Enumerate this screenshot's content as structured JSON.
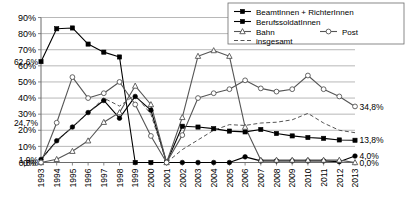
{
  "chart_data": {
    "type": "line",
    "title": "",
    "subtitle": "",
    "xlabel": "",
    "ylabel": "",
    "ylim": [
      0,
      90
    ],
    "xlim": [
      1993,
      2013
    ],
    "grid": true,
    "legend_position": "top-right",
    "ytick_labels": [
      "90%",
      "80%",
      "70%",
      "60%",
      "50%",
      "40%",
      "30%",
      "20%",
      "10%",
      "0%"
    ],
    "ytick_values": [
      90,
      80,
      70,
      60,
      50,
      40,
      30,
      20,
      10,
      0
    ],
    "categories": [
      "1993",
      "1994",
      "1995",
      "1996",
      "1997",
      "1998",
      "1999",
      "2000",
      "2001",
      "2002",
      "2003",
      "2004",
      "2005",
      "2006",
      "2007",
      "2008",
      "2009",
      "2010",
      "2011",
      "2012",
      "2013"
    ],
    "x": [
      1993,
      1994,
      1995,
      1996,
      1997,
      1998,
      1999,
      2000,
      2001,
      2002,
      2003,
      2004,
      2005,
      2006,
      2007,
      2008,
      2009,
      2010,
      2011,
      2012,
      2013
    ],
    "series": [
      {
        "name": "BeamtInnen + RichterInnen",
        "marker": "filled-square",
        "line": "solid",
        "color": "#000000",
        "values": [
          62.6,
          83.0,
          83.5,
          73.5,
          68.5,
          65.5,
          0.0,
          0.0,
          0.0,
          22.5,
          22.0,
          21.0,
          19.5,
          19.0,
          20.5,
          18.0,
          16.5,
          15.5,
          15.0,
          14.0,
          13.8
        ]
      },
      {
        "name": "BerufssoldatInnen",
        "marker": "filled-circle",
        "line": "solid",
        "color": "#000000",
        "values": [
          1.9,
          13.5,
          22.0,
          31.0,
          38.5,
          27.5,
          41.0,
          32.5,
          0.0,
          0.0,
          0.0,
          0.0,
          0.0,
          3.5,
          1.0,
          1.0,
          1.0,
          1.0,
          1.0,
          0.5,
          4.0
        ]
      },
      {
        "name": "Bahn",
        "marker": "open-triangle",
        "line": "solid",
        "color": "#555555",
        "values": [
          0.0,
          2.0,
          7.0,
          13.5,
          25.0,
          31.0,
          47.5,
          36.0,
          0.0,
          28.0,
          66.0,
          69.5,
          66.0,
          22.0,
          1.5,
          1.5,
          1.5,
          1.5,
          1.5,
          1.5,
          0.0
        ]
      },
      {
        "name": "Post",
        "marker": "open-circle",
        "line": "solid",
        "color": "#555555",
        "values": [
          0.0,
          24.7,
          53.0,
          40.0,
          43.0,
          50.0,
          36.0,
          16.5,
          0.0,
          17.0,
          40.0,
          43.0,
          45.5,
          51.0,
          46.0,
          44.0,
          45.5,
          54.0,
          45.5,
          41.0,
          34.8
        ]
      },
      {
        "name": "insgesamt",
        "marker": "none",
        "line": "dashed",
        "color": "#555555",
        "values": [
          1.5,
          13.0,
          22.0,
          30.5,
          40.0,
          35.0,
          42.0,
          30.0,
          0.0,
          8.0,
          14.0,
          20.0,
          23.5,
          23.0,
          24.5,
          25.0,
          26.5,
          30.5,
          24.5,
          20.0,
          18.5
        ]
      }
    ],
    "annotations": [
      {
        "text": "62,6%",
        "x_index": 0,
        "value": 62.6,
        "side": "left"
      },
      {
        "text": "24,7%",
        "x_index": 0,
        "value": 24.7,
        "side": "left"
      },
      {
        "text": "1,9%",
        "x_index": 0,
        "value": 1.9,
        "side": "left"
      },
      {
        "text": "0,0%",
        "x_index": 0,
        "value": 0.0,
        "side": "left"
      },
      {
        "text": "34,8%",
        "x_index": 20,
        "value": 34.8,
        "side": "right"
      },
      {
        "text": "13,8%",
        "x_index": 20,
        "value": 13.8,
        "side": "right"
      },
      {
        "text": "4,0%",
        "x_index": 20,
        "value": 4.0,
        "side": "right"
      },
      {
        "text": "0,0%",
        "x_index": 20,
        "value": 0.0,
        "side": "right"
      }
    ],
    "legend": [
      {
        "label": "BeamtInnen + RichterInnen",
        "marker": "filled-square",
        "line": "solid"
      },
      {
        "label": "BerufssoldatInnen",
        "marker": "filled-square",
        "line": "solid"
      },
      {
        "label": "Bahn",
        "marker": "open-triangle",
        "line": "solid"
      },
      {
        "label": "Post",
        "marker": "open-circle",
        "line": "solid"
      },
      {
        "label": "insgesamt",
        "marker": "none",
        "line": "dashed"
      }
    ]
  }
}
